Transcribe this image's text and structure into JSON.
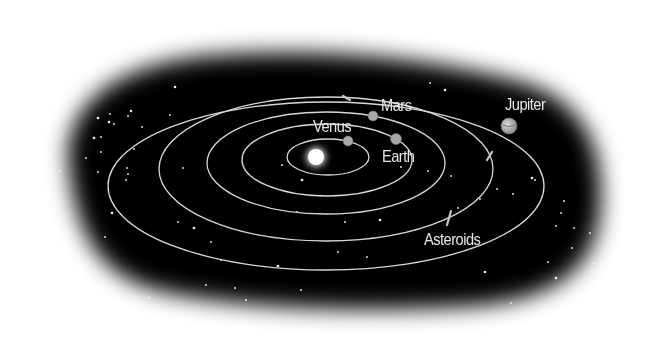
{
  "diagram": {
    "colors": {
      "background": "#ffffff",
      "space": "#050505",
      "orbit": "#d8d8d8",
      "planet": "#a8a8a8",
      "label": "#e6e6e6",
      "sun": "#ffffff",
      "star": "#f0f0f0"
    },
    "sun": {
      "name": "Sun",
      "cx": 316,
      "cy": 157,
      "r": 8
    },
    "orbits": [
      {
        "name": "orbit-1",
        "cx": 328,
        "cy": 157,
        "rx": 41,
        "ry": 18
      },
      {
        "name": "orbit-venus",
        "cx": 327,
        "cy": 160,
        "rx": 85,
        "ry": 36
      },
      {
        "name": "orbit-earth",
        "cx": 326,
        "cy": 163,
        "rx": 119,
        "ry": 51
      },
      {
        "name": "orbit-mars",
        "cx": 326,
        "cy": 169,
        "rx": 167,
        "ry": 72
      },
      {
        "name": "orbit-jupiter",
        "cx": 326,
        "cy": 186,
        "rx": 218,
        "ry": 84
      }
    ],
    "planets": [
      {
        "name": "Venus",
        "cx": 348,
        "cy": 141,
        "r": 5
      },
      {
        "name": "Earth",
        "cx": 396,
        "cy": 139,
        "r": 5.5
      },
      {
        "name": "Mars",
        "cx": 373,
        "cy": 116,
        "r": 5
      },
      {
        "name": "Jupiter",
        "cx": 509,
        "cy": 126,
        "r": 8
      }
    ],
    "labels": {
      "venus": "Venus",
      "mars": "Mars",
      "earth": "Earth",
      "jupiter": "Jupiter",
      "asteroids": "Asteroids"
    },
    "asteroids": [
      {
        "x1": 343,
        "y1": 96,
        "x2": 350,
        "y2": 100
      },
      {
        "x1": 487,
        "y1": 160,
        "x2": 492,
        "y2": 152
      },
      {
        "x1": 447,
        "y1": 225,
        "x2": 451,
        "y2": 211
      }
    ],
    "stars": [
      [
        98,
        118
      ],
      [
        86,
        158
      ],
      [
        98,
        172
      ],
      [
        110,
        114
      ],
      [
        109,
        122
      ],
      [
        114,
        124
      ],
      [
        101,
        137
      ],
      [
        128,
        116
      ],
      [
        131,
        111
      ],
      [
        60,
        171
      ],
      [
        57,
        213
      ],
      [
        44,
        189
      ],
      [
        94,
        138
      ],
      [
        101,
        152
      ],
      [
        126,
        180
      ],
      [
        170,
        115
      ],
      [
        175,
        87
      ],
      [
        142,
        127
      ],
      [
        134,
        149
      ],
      [
        127,
        168
      ],
      [
        112,
        213
      ],
      [
        105,
        237
      ],
      [
        128,
        174
      ],
      [
        183,
        168
      ],
      [
        194,
        228
      ],
      [
        211,
        242
      ],
      [
        221,
        260
      ],
      [
        178,
        222
      ],
      [
        149,
        298
      ],
      [
        206,
        285
      ],
      [
        235,
        288
      ],
      [
        246,
        300
      ],
      [
        278,
        266
      ],
      [
        301,
        290
      ],
      [
        338,
        252
      ],
      [
        367,
        257
      ],
      [
        380,
        220
      ],
      [
        451,
        176
      ],
      [
        428,
        171
      ],
      [
        401,
        167
      ],
      [
        445,
        90
      ],
      [
        430,
        83
      ],
      [
        458,
        208
      ],
      [
        480,
        199
      ],
      [
        485,
        272
      ],
      [
        497,
        189
      ],
      [
        513,
        194
      ],
      [
        535,
        180
      ],
      [
        532,
        178
      ],
      [
        556,
        226
      ],
      [
        561,
        213
      ],
      [
        572,
        248
      ],
      [
        556,
        278
      ],
      [
        548,
        262
      ],
      [
        574,
        228
      ],
      [
        590,
        233
      ],
      [
        594,
        263
      ],
      [
        564,
        201
      ],
      [
        511,
        303
      ],
      [
        345,
        222
      ],
      [
        302,
        180
      ],
      [
        282,
        165
      ],
      [
        297,
        212
      ]
    ]
  }
}
